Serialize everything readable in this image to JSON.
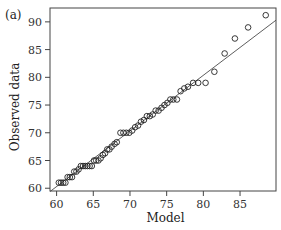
{
  "chart_data": {
    "type": "scatter",
    "panel_label": "(a)",
    "title": "",
    "xlabel": "Model",
    "ylabel": "Observed data",
    "xlim": [
      59.1,
      89.9
    ],
    "ylim": [
      59.5,
      92.5
    ],
    "xticks": [
      60,
      65,
      70,
      75,
      80,
      85
    ],
    "yticks": [
      60,
      65,
      70,
      75,
      80,
      85,
      90
    ],
    "grid": false,
    "legend": null,
    "series": [
      {
        "name": "Observed vs Model",
        "marker": "open-circle",
        "points": [
          [
            60.3,
            61
          ],
          [
            60.6,
            61
          ],
          [
            60.9,
            61
          ],
          [
            61.2,
            61
          ],
          [
            61.5,
            62
          ],
          [
            61.8,
            62
          ],
          [
            62.1,
            62
          ],
          [
            62.4,
            63
          ],
          [
            62.7,
            63
          ],
          [
            63.0,
            63.4
          ],
          [
            63.3,
            64
          ],
          [
            63.6,
            64
          ],
          [
            63.9,
            64
          ],
          [
            64.2,
            64
          ],
          [
            64.5,
            64
          ],
          [
            64.8,
            64
          ],
          [
            65.1,
            65
          ],
          [
            65.4,
            65
          ],
          [
            65.7,
            65
          ],
          [
            66.0,
            65.4
          ],
          [
            66.3,
            66
          ],
          [
            66.6,
            66.3
          ],
          [
            66.9,
            67
          ],
          [
            67.2,
            67
          ],
          [
            67.5,
            67.5
          ],
          [
            67.9,
            68
          ],
          [
            68.2,
            68.3
          ],
          [
            68.7,
            70
          ],
          [
            69.1,
            70
          ],
          [
            69.5,
            70
          ],
          [
            69.9,
            70
          ],
          [
            70.3,
            70.4
          ],
          [
            70.7,
            71
          ],
          [
            71.1,
            71.3
          ],
          [
            71.5,
            72
          ],
          [
            71.9,
            72.3
          ],
          [
            72.3,
            73
          ],
          [
            72.7,
            73
          ],
          [
            73.1,
            73.3
          ],
          [
            73.5,
            74
          ],
          [
            73.9,
            74
          ],
          [
            74.3,
            74.5
          ],
          [
            74.7,
            75
          ],
          [
            75.1,
            75.4
          ],
          [
            75.5,
            76
          ],
          [
            75.9,
            76
          ],
          [
            76.4,
            76
          ],
          [
            76.9,
            77.5
          ],
          [
            77.4,
            78
          ],
          [
            77.9,
            78.3
          ],
          [
            78.6,
            79
          ],
          [
            79.3,
            79
          ],
          [
            80.3,
            79
          ],
          [
            81.5,
            81
          ],
          [
            82.9,
            84.3
          ],
          [
            84.3,
            87
          ],
          [
            86.1,
            89
          ],
          [
            88.5,
            91.2
          ]
        ]
      }
    ],
    "reference_line": {
      "type": "line",
      "style": "solid",
      "x": [
        59.1,
        89.9
      ],
      "y": [
        59.4,
        90.3
      ]
    }
  }
}
